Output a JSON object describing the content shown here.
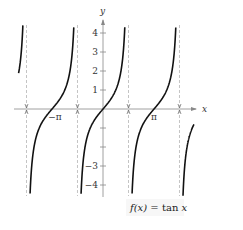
{
  "chart_data": {
    "type": "line",
    "title": "",
    "function_label": {
      "prefix": "f(x)",
      "eq": " = ",
      "body": "tan ",
      "var": "x"
    },
    "xlabel": "x",
    "ylabel": "y",
    "x_tick_labels": [
      {
        "value": -3.14159,
        "label": "−π"
      },
      {
        "value": 3.14159,
        "label": "π"
      }
    ],
    "y_ticks": [
      -4,
      -3,
      -2,
      -1,
      1,
      2,
      3,
      4
    ],
    "y_tick_labels": [
      {
        "value": 4,
        "label": "4"
      },
      {
        "value": 3,
        "label": "3"
      },
      {
        "value": 2,
        "label": "2"
      },
      {
        "value": 1,
        "label": "1"
      },
      {
        "value": -3,
        "label": "−3"
      },
      {
        "value": -4,
        "label": "−4"
      }
    ],
    "asymptotes": [
      -4.712,
      -1.571,
      1.571,
      4.712
    ],
    "xlim": [
      -5.2,
      5.6
    ],
    "ylim": [
      -4.6,
      4.4
    ],
    "grid": false,
    "series": [
      {
        "name": "tan x",
        "function": "tan",
        "domain": [
          -5.2,
          5.6
        ]
      }
    ],
    "colors": {
      "curve": "#111111",
      "axis": "#888888",
      "asymptote": "#aaaaaa",
      "text": "#333333"
    }
  }
}
